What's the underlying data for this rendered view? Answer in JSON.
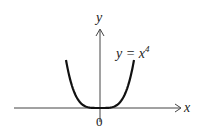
{
  "chart_data": {
    "type": "line",
    "title": "",
    "function": "y = x^4",
    "xlabel": "x",
    "ylabel": "y",
    "origin_label": "0",
    "curve_label": "y = x",
    "curve_label_exponent": "4",
    "series": [
      {
        "name": "y = x^4",
        "x": [
          -1.0,
          -0.9,
          -0.8,
          -0.7,
          -0.6,
          -0.5,
          -0.4,
          -0.3,
          -0.2,
          -0.1,
          0,
          0.1,
          0.2,
          0.3,
          0.4,
          0.5,
          0.6,
          0.7,
          0.8,
          0.9,
          1.0
        ],
        "y": [
          1.0,
          0.6561,
          0.4096,
          0.2401,
          0.1296,
          0.0625,
          0.0256,
          0.0081,
          0.0016,
          0.0001,
          0,
          0.0001,
          0.0016,
          0.0081,
          0.0256,
          0.0625,
          0.1296,
          0.2401,
          0.4096,
          0.6561,
          1.0
        ]
      }
    ],
    "xlim": [
      -1.0,
      1.0
    ],
    "ylim": [
      0,
      1.0
    ],
    "grid": false,
    "legend": "none",
    "ticks": "none"
  }
}
